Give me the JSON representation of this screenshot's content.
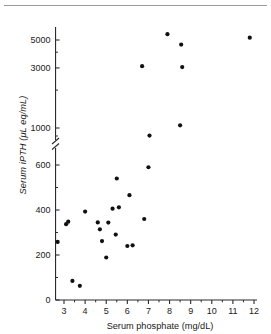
{
  "figure": {
    "has_top_rule": true,
    "background_color": "#ffffff",
    "marker_color": "#111111"
  },
  "chart_data": {
    "type": "scatter",
    "title": "",
    "xlabel": "Serum phosphate (mg/dL)",
    "ylabel": "Serum iPTH (μL eq/mL)",
    "xlim": [
      2.6,
      12.0
    ],
    "ylim": [
      0,
      5600
    ],
    "grid": false,
    "legend": null,
    "axis_break": {
      "present": true,
      "between": [
        600,
        1000
      ],
      "style": "double-slash"
    },
    "xticks": [
      3,
      4,
      5,
      6,
      7,
      8,
      9,
      10,
      11,
      12
    ],
    "xtick_labels": [
      "3",
      "4",
      "5",
      "6",
      "7",
      "8",
      "9",
      "10",
      "11",
      "12"
    ],
    "x_minor_ticks": [
      3.5,
      4.5,
      5.5,
      6.5,
      7.5,
      8.5,
      9.5,
      10.5,
      11.5
    ],
    "yticks_lower": [
      0,
      200,
      400,
      600
    ],
    "ytick_labels_lower": [
      "0",
      "200",
      "400",
      "600"
    ],
    "y_minor_ticks_lower": [
      100,
      300,
      500
    ],
    "yticks_upper": [
      1000,
      3000,
      5000
    ],
    "ytick_labels_upper": [
      "1000",
      "3000",
      "5000"
    ],
    "y_minor_ticks_upper": [
      2000,
      4000
    ],
    "n_points": 30,
    "points": [
      {
        "x": 2.7,
        "y": 258
      },
      {
        "x": 3.1,
        "y": 337
      },
      {
        "x": 3.2,
        "y": 348
      },
      {
        "x": 3.4,
        "y": 85
      },
      {
        "x": 3.75,
        "y": 63
      },
      {
        "x": 4.0,
        "y": 393
      },
      {
        "x": 4.6,
        "y": 345
      },
      {
        "x": 4.7,
        "y": 314
      },
      {
        "x": 4.8,
        "y": 262
      },
      {
        "x": 5.0,
        "y": 189
      },
      {
        "x": 5.1,
        "y": 344
      },
      {
        "x": 5.3,
        "y": 406
      },
      {
        "x": 5.45,
        "y": 291
      },
      {
        "x": 5.5,
        "y": 540
      },
      {
        "x": 5.6,
        "y": 412
      },
      {
        "x": 6.0,
        "y": 240
      },
      {
        "x": 6.1,
        "y": 466
      },
      {
        "x": 6.25,
        "y": 243
      },
      {
        "x": 6.7,
        "y": 3100
      },
      {
        "x": 6.8,
        "y": 360
      },
      {
        "x": 7.0,
        "y": 590
      },
      {
        "x": 7.05,
        "y": 870
      },
      {
        "x": 7.9,
        "y": 5560
      },
      {
        "x": 8.5,
        "y": 1050
      },
      {
        "x": 8.55,
        "y": 4600
      },
      {
        "x": 8.6,
        "y": 3050
      },
      {
        "x": 11.8,
        "y": 5220
      }
    ]
  }
}
